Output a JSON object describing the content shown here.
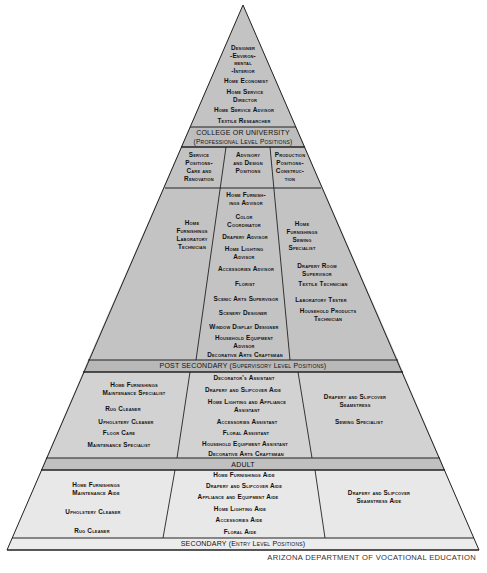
{
  "colors": {
    "top_fill": "#c3c3c3",
    "label_bar_fill": "#b8b8b8",
    "post_secondary_fill": "#cfcfcf",
    "adult_fill": "#e6e6e6",
    "line": "#222222"
  },
  "apex": {
    "items": [
      "Designer\n-Environ-\nmental\n-Interior",
      "Home Economist",
      "Home Service\nDirector",
      "Home Service Advisor",
      "Textile Researcher"
    ]
  },
  "college": {
    "label_line1": "COLLEGE OR UNIVERSITY",
    "label_line2": "(Professional Level Positions)",
    "columns": [
      {
        "header": "Service\nPositions-\nCare and\nRenovation",
        "items": [
          "Home\nFurnishings\nLaboratory\nTechnician"
        ]
      },
      {
        "header": "Advisory\nand Design\nPositions",
        "items": [
          "Home Furnish-\nings Advisor",
          "Color\nCoordinator",
          "Drapery Advisor",
          "Home Lighting\nAdvisor",
          "Accessories Advisor",
          "Florist",
          "Scenic Arts Supervisor",
          "Scenery Designer",
          "Window Display Designer",
          "Household Equipment\nAdvisor",
          "Decorative Arts Craftsman"
        ]
      },
      {
        "header": "Production\nPositions-\nConstruc-\ntion",
        "items": [
          "Home\nFurnishings\nSewing\nSpecialist",
          "Drapery Room\nSupervisor",
          "Textile Technician",
          "Laboratory Tester",
          "Household Products\nTechnician"
        ]
      }
    ]
  },
  "post_secondary": {
    "label": "POST SECONDARY (Supervisory Level Positions)",
    "columns": [
      {
        "items": [
          "Home Furnishings\nMaintenance Specialist",
          "Rug Cleaner",
          "Upholstery Cleaner",
          "Floor Care",
          "Maintenance Specialist"
        ]
      },
      {
        "items": [
          "Decorator's Assistant",
          "Drapery and Slipcover Aide",
          "Home Lighting and Appliance\nAssistant",
          "Accessories Assistant",
          "Floral Assistant",
          "Household Equipment Assistant",
          "Decorative Arts Craftsman"
        ]
      },
      {
        "items": [
          "Drapery and Slipcover\nSeamstress",
          "Sewing Specialist"
        ]
      }
    ]
  },
  "adult": {
    "label": "ADULT",
    "columns": [
      {
        "items": [
          "Home Furnishings\nMaintenance Aide",
          "Upholstery Cleaner",
          "Rug Cleaner"
        ]
      },
      {
        "items": [
          "Home Furnishings Aide",
          "Drapery and Slipcover Aide",
          "Appliance and Equipment Aide",
          "Home Lighting Aide",
          "Accessories Aide",
          "Floral Aide"
        ]
      },
      {
        "items": [
          "Drapery and Slipcover\nSeamstress Aide"
        ]
      }
    ]
  },
  "secondary": {
    "label": "SECONDARY (Entry Level Positions)"
  },
  "credit": "ARIZONA DEPARTMENT OF VOCATIONAL EDUCATION"
}
